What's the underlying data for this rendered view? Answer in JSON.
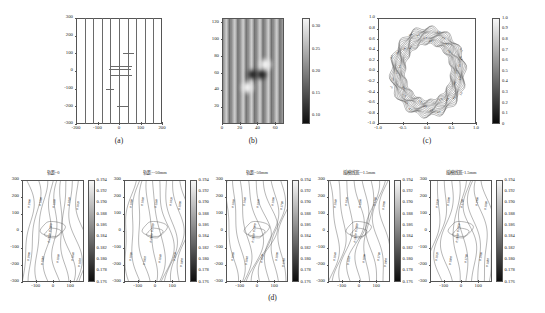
{
  "figure": {
    "panel_labels": [
      "(a)",
      "(b)",
      "(c)",
      "(d)"
    ]
  },
  "chart_data": [
    {
      "id": "panel-a",
      "type": "line",
      "title": "",
      "label": "(a)",
      "xlabel": "",
      "ylabel": "",
      "xlim": [
        -200,
        200
      ],
      "ylim": [
        -300,
        300
      ],
      "xticks": [
        -200,
        -100,
        0,
        100,
        200
      ],
      "xtick_labels": [
        "-200",
        "-100",
        "0",
        "100",
        "200"
      ],
      "yticks": [
        -300,
        -200,
        -100,
        0,
        100,
        200,
        300
      ],
      "ytick_labels": [
        "-300",
        "-200",
        "-100",
        "0",
        "100",
        "200",
        "300"
      ],
      "grid": false,
      "series": [
        {
          "name": "trace-1",
          "x": -160,
          "kind": "vertical-line"
        },
        {
          "name": "trace-2",
          "x": -120,
          "kind": "vertical-line"
        },
        {
          "name": "trace-3",
          "x": -80,
          "kind": "vertical-line"
        },
        {
          "name": "trace-4",
          "x": -40,
          "kind": "vertical-line"
        },
        {
          "name": "trace-5",
          "x": 0,
          "kind": "vertical-line"
        },
        {
          "name": "trace-6",
          "x": 40,
          "kind": "vertical-line"
        },
        {
          "name": "trace-7",
          "x": 80,
          "kind": "vertical-line"
        },
        {
          "name": "trace-8",
          "x": 120,
          "kind": "vertical-line"
        },
        {
          "name": "trace-9",
          "x": 160,
          "kind": "vertical-line"
        }
      ],
      "annotations": [
        {
          "kind": "horizontal-segment",
          "y": 100,
          "x0": 20,
          "x1": 70
        },
        {
          "kind": "horizontal-segment",
          "y": 30,
          "x0": -40,
          "x1": 60
        },
        {
          "kind": "horizontal-segment",
          "y": 10,
          "x0": -45,
          "x1": 55
        },
        {
          "kind": "horizontal-segment",
          "y": -20,
          "x0": -40,
          "x1": 60
        },
        {
          "kind": "horizontal-segment",
          "y": -100,
          "x0": -60,
          "x1": -25
        },
        {
          "kind": "horizontal-segment",
          "y": -200,
          "x0": -10,
          "x1": 40
        }
      ]
    },
    {
      "id": "panel-b",
      "type": "heatmap",
      "title": "",
      "label": "(b)",
      "xlabel": "",
      "ylabel": "",
      "xlim": [
        0,
        70
      ],
      "ylim": [
        0,
        125
      ],
      "xticks": [
        0,
        20,
        40,
        60
      ],
      "xtick_labels": [
        "0",
        "20",
        "40",
        "60"
      ],
      "yticks": [
        20,
        40,
        60,
        80,
        100,
        120
      ],
      "ytick_labels": [
        "20",
        "40",
        "60",
        "80",
        "100",
        "120"
      ],
      "colorbar": {
        "ticks": [
          0.1,
          0.15,
          0.2,
          0.25,
          0.3
        ],
        "tick_labels": [
          "0.10",
          "0.15",
          "0.20",
          "0.25",
          "0.30"
        ],
        "vmin": 0.08,
        "vmax": 0.32,
        "cmap": "gray"
      },
      "pattern": "vertical interference fringes",
      "features": [
        {
          "name": "dark-spot-left",
          "x": 33,
          "y": 60,
          "value": 0.09
        },
        {
          "name": "dark-spot-right",
          "x": 43,
          "y": 60,
          "value": 0.09
        },
        {
          "name": "bright-spot-lower-left",
          "x": 28,
          "y": 44,
          "value": 0.31
        },
        {
          "name": "bright-spot-upper-right",
          "x": 48,
          "y": 71,
          "value": 0.31
        }
      ]
    },
    {
      "id": "panel-c",
      "type": "heatmap",
      "title": "",
      "label": "(c)",
      "xlabel": "",
      "ylabel": "",
      "xlim": [
        -1.0,
        1.0
      ],
      "ylim": [
        -1.0,
        1.0
      ],
      "xticks": [
        -1.0,
        -0.5,
        0.0,
        0.5,
        1.0
      ],
      "xtick_labels": [
        "-1.0",
        "-0.5",
        "0.0",
        "0.5",
        "1.0"
      ],
      "yticks": [
        -1.0,
        -0.8,
        -0.6,
        -0.4,
        -0.2,
        0.0,
        0.2,
        0.4,
        0.6,
        0.8,
        1.0
      ],
      "ytick_labels": [
        "-1.0",
        "-0.8",
        "-0.6",
        "-0.4",
        "-0.2",
        "0.0",
        "0.2",
        "0.4",
        "0.6",
        "0.8",
        "1.0"
      ],
      "colorbar": {
        "ticks": [
          0,
          0.1,
          0.2,
          0.3,
          0.4,
          0.5,
          0.6,
          0.7,
          0.8,
          0.9,
          1.0
        ],
        "tick_labels": [
          "0",
          "0.1",
          "0.2",
          "0.3",
          "0.4",
          "0.5",
          "0.6",
          "0.7",
          "0.8",
          "0.9",
          "1.0"
        ],
        "vmin": 0,
        "vmax": 1.0,
        "cmap": "gray"
      },
      "pattern": "annular contour ring with dense labelled contour lines",
      "contour_labels": [
        "0.2",
        "0.3",
        "0.4",
        "0.5",
        "0.6",
        "0.7",
        "0.8"
      ]
    }
  ],
  "panel_d": {
    "label": "(d)",
    "colorbar": {
      "ticks": [
        0.176,
        0.178,
        0.18,
        0.182,
        0.184,
        0.186,
        0.188,
        0.19,
        0.192,
        0.194
      ],
      "tick_labels": [
        "0.176",
        "0.178",
        "0.180",
        "0.182",
        "0.184",
        "0.186",
        "0.188",
        "0.190",
        "0.192",
        "0.194"
      ],
      "vmin": 0.176,
      "vmax": 0.194,
      "cmap": "gray"
    },
    "axes": {
      "xlim": [
        -180,
        180
      ],
      "ylim": [
        -300,
        300
      ],
      "xticks": [
        -100,
        0,
        100
      ],
      "xtick_labels": [
        "-100",
        "0",
        "100"
      ],
      "yticks": [
        -300,
        -200,
        -100,
        0,
        100,
        200,
        300
      ],
      "ytick_labels": [
        "-300",
        "-200",
        "-100",
        "0",
        "100",
        "200",
        "300"
      ]
    },
    "contour_labels": [
      "0.1900",
      "0.1880",
      "0.1860",
      "0.1840",
      "0.1820",
      "0.1800",
      "0.1780"
    ],
    "subplots": [
      {
        "id": "d1",
        "title": "轨距=0",
        "type": "contour"
      },
      {
        "id": "d2",
        "title": "轨距=-50mm",
        "type": "contour"
      },
      {
        "id": "d3",
        "title": "轨距=50mm",
        "type": "contour"
      },
      {
        "id": "d4",
        "title": "摇模线宽=-1.5mm",
        "type": "contour"
      },
      {
        "id": "d5",
        "title": "摇模线宽=1.5mm",
        "type": "contour"
      }
    ]
  }
}
